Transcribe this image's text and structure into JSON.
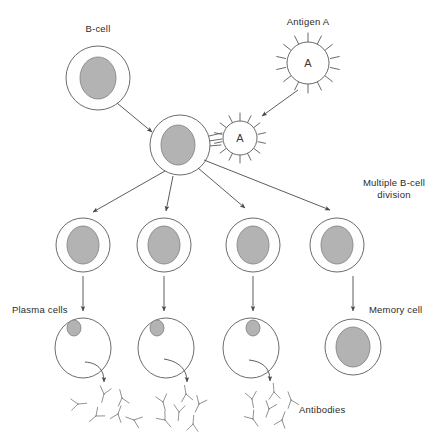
{
  "diagram": {
    "canvas": {
      "width": 439,
      "height": 442
    },
    "colors": {
      "background": "#ffffff",
      "nucleus_fill": "#b3b3b3",
      "nucleus_stroke": "#7d7d7d",
      "cell_stroke": "#5a5a5a",
      "arrow_stroke": "#4a4a4a",
      "label_text": "#2b2b2b"
    },
    "labels": {
      "b_cell": "B-cell",
      "antigen_a": "Antigen A",
      "antigen_glyph": "A",
      "antigen_glyph_bound": "A",
      "multiple_division_line1": "Multiple B-cell",
      "multiple_division_line2": "division",
      "plasma_cells": "Plasma cells",
      "memory_cell": "Memory cell",
      "antibodies": "Antibodies"
    },
    "nodes": {
      "b_cell": {
        "cx": 98,
        "cy": 78,
        "r_outer": 32,
        "r_inner": 22,
        "nucleus_rx": 18,
        "nucleus_ry": 21
      },
      "antigen_free": {
        "cx": 308,
        "cy": 63,
        "r": 21,
        "spikes": 14
      },
      "antigen_bound": {
        "cx": 240,
        "cy": 138,
        "r": 17,
        "spikes": 14
      },
      "activated_b_cell": {
        "cx": 180,
        "cy": 145,
        "r_outer": 30,
        "r_inner": 21,
        "nucleus_rx": 17,
        "nucleus_ry": 20
      },
      "daughters": [
        {
          "cx": 83,
          "cy": 245,
          "r_outer": 27,
          "r_inner": 19,
          "nucleus_rx": 16,
          "nucleus_ry": 19
        },
        {
          "cx": 164,
          "cy": 245,
          "r_outer": 27,
          "r_inner": 19,
          "nucleus_rx": 16,
          "nucleus_ry": 19
        },
        {
          "cx": 253,
          "cy": 245,
          "r_outer": 27,
          "r_inner": 19,
          "nucleus_rx": 16,
          "nucleus_ry": 19
        },
        {
          "cx": 337,
          "cy": 245,
          "r_outer": 27,
          "r_inner": 19,
          "nucleus_rx": 16,
          "nucleus_ry": 19
        }
      ],
      "plasma_cells": [
        {
          "cx": 83,
          "cy": 348,
          "rx": 28,
          "ry": 30,
          "nucleus_cx": 74,
          "nucleus_cy": 328,
          "nucleus_rx": 7,
          "nucleus_ry": 8
        },
        {
          "cx": 166,
          "cy": 348,
          "rx": 28,
          "ry": 30,
          "nucleus_cx": 157,
          "nucleus_cy": 328,
          "nucleus_rx": 7,
          "nucleus_ry": 8
        },
        {
          "cx": 251,
          "cy": 348,
          "rx": 28,
          "ry": 30,
          "nucleus_cx": 253,
          "nucleus_cy": 328,
          "nucleus_rx": 7,
          "nucleus_ry": 8
        }
      ],
      "memory_cell": {
        "cx": 353,
        "cy": 347,
        "r_outer": 28,
        "r_inner": 20,
        "nucleus_rx": 17,
        "nucleus_ry": 20
      },
      "antibody_clusters": [
        {
          "x": 100,
          "y": 408,
          "count": 6
        },
        {
          "x": 185,
          "y": 408,
          "count": 6
        },
        {
          "x": 268,
          "y": 405,
          "count": 6
        }
      ]
    },
    "label_positions": {
      "b_cell": {
        "x": 98,
        "y": 32
      },
      "antigen_a": {
        "x": 308,
        "y": 25
      },
      "multiple_division": {
        "x": 394,
        "y": 190
      },
      "plasma_cells": {
        "x": 12,
        "y": 313
      },
      "memory_cell": {
        "x": 369,
        "y": 313
      },
      "antibodies": {
        "x": 297,
        "y": 411
      }
    },
    "flow_description": [
      "A B-cell encounters free Antigen A",
      "Antigen A binds to the B-cell surface receptors, activating it",
      "The activated B-cell undergoes multiple B-cell division producing four daughter cells",
      "Three daughter cells become plasma cells that secrete antibodies",
      "One daughter cell becomes a memory cell"
    ]
  }
}
